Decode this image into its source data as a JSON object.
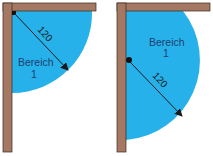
{
  "diagram": {
    "colors": {
      "wall": "#a47862",
      "wall_stroke": "#3a2a22",
      "area": "#27b1ea",
      "text": "#1d3f6e",
      "arrow": "#1a1a1a"
    },
    "panels": [
      {
        "id": "left",
        "area_label_line1": "Bereich",
        "area_label_line2": "1",
        "radius_label": "120"
      },
      {
        "id": "right",
        "area_label_line1": "Bereich",
        "area_label_line2": "1",
        "radius_label": "120"
      }
    ]
  }
}
